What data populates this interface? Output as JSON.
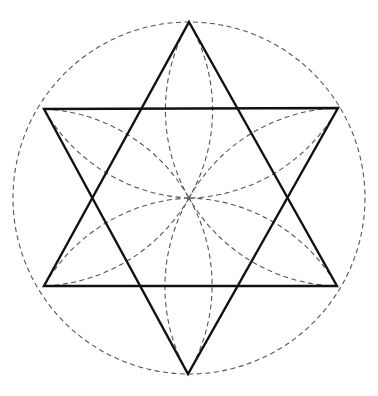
{
  "diagram": {
    "title": "",
    "colors": {
      "background": "#ffffff",
      "solid_stroke": "#111111",
      "dashed_stroke": "#555555"
    },
    "center": [
      189,
      198
    ],
    "radius": 176,
    "vertices": {
      "top": [
        189,
        22
      ],
      "upper_right": [
        338,
        108
      ],
      "lower_right": [
        337,
        286
      ],
      "bottom": [
        188,
        374
      ],
      "lower_left": [
        44,
        286
      ],
      "upper_left": [
        44,
        109
      ]
    },
    "triangles": [
      {
        "name": "upward-triangle",
        "points": [
          "top",
          "lower_right",
          "lower_left"
        ]
      },
      {
        "name": "downward-triangle",
        "points": [
          "upper_left",
          "upper_right",
          "bottom"
        ]
      }
    ],
    "petals": [
      "top",
      "upper_right",
      "lower_right",
      "bottom",
      "lower_left",
      "upper_left"
    ]
  }
}
